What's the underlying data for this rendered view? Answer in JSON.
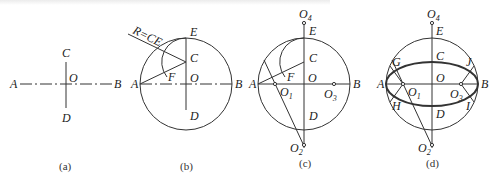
{
  "figure": {
    "panels": [
      {
        "id": "a",
        "caption": "(a)",
        "labels": {
          "A": "A",
          "B": "B",
          "C": "C",
          "D": "D",
          "O": "O"
        }
      },
      {
        "id": "b",
        "caption": "(b)",
        "labels": {
          "A": "A",
          "B": "B",
          "C": "C",
          "D": "D",
          "E": "E",
          "F": "F",
          "O": "O",
          "R": "R=CE"
        }
      },
      {
        "id": "c",
        "caption": "(c)",
        "labels": {
          "A": "A",
          "B": "B",
          "C": "C",
          "D": "D",
          "E": "E",
          "F": "F",
          "O": "O",
          "O1": "O",
          "O1_sub": "1",
          "O2": "O",
          "O2_sub": "2",
          "O3": "O",
          "O3_sub": "3",
          "O4": "O",
          "O4_sub": "4"
        }
      },
      {
        "id": "d",
        "caption": "(d)",
        "labels": {
          "A": "A",
          "B": "B",
          "C": "C",
          "D": "D",
          "E": "E",
          "G": "G",
          "H": "H",
          "I": "I",
          "J": "J",
          "O": "O",
          "O1": "O",
          "O1_sub": "1",
          "O2": "O",
          "O2_sub": "2",
          "O3": "O",
          "O3_sub": "3",
          "O4": "O",
          "O4_sub": "4"
        }
      }
    ],
    "colors": {
      "line": "#333333",
      "text": "#222222",
      "background": "#ffffff"
    }
  }
}
